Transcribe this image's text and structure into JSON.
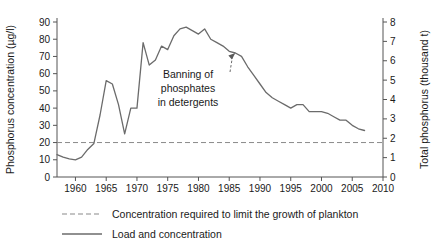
{
  "chart_data": {
    "type": "line",
    "title": "",
    "xlabel": "",
    "ylabel": "Phosphorus concentration (µg/l)",
    "y2label": "Total phosphorus (thousand t)",
    "xlim": [
      1957,
      2010
    ],
    "ylim": [
      0,
      90
    ],
    "y2lim": [
      0,
      8
    ],
    "grid": false,
    "legend_position": "bottom-left",
    "x_ticks": [
      1960,
      1965,
      1970,
      1975,
      1980,
      1985,
      1990,
      1995,
      2000,
      2005,
      2010
    ],
    "y_ticks": [
      0,
      10,
      20,
      30,
      40,
      50,
      60,
      70,
      80,
      90
    ],
    "y2_ticks": [
      0,
      1,
      2,
      3,
      4,
      5,
      6,
      7,
      8
    ],
    "series": [
      {
        "name": "Load and concentration",
        "style": "solid",
        "color": "#6b6b6b",
        "x": [
          1957,
          1958,
          1959,
          1960,
          1961,
          1962,
          1963,
          1964,
          1965,
          1966,
          1967,
          1968,
          1969,
          1970,
          1971,
          1972,
          1973,
          1974,
          1975,
          1976,
          1977,
          1978,
          1979,
          1980,
          1981,
          1982,
          1983,
          1984,
          1985,
          1986,
          1987,
          1988,
          1989,
          1990,
          1991,
          1992,
          1993,
          1994,
          1995,
          1996,
          1997,
          1998,
          1999,
          2000,
          2001,
          2002,
          2003,
          2004,
          2005,
          2006,
          2007
        ],
        "y": [
          13,
          11.5,
          10.5,
          10,
          11.5,
          16,
          19.5,
          36,
          56,
          54,
          42,
          25,
          40,
          40,
          78,
          65,
          68,
          76,
          74,
          82,
          86,
          87,
          85,
          83,
          86,
          80,
          78,
          76,
          73,
          72,
          70,
          64,
          59,
          54,
          49,
          46,
          44,
          42,
          40,
          42,
          42,
          38,
          38,
          38,
          37,
          35,
          33,
          33,
          30,
          28,
          27
        ]
      },
      {
        "name": "Concentration required to limit the growth of plankton",
        "style": "dashed",
        "color": "#8a8a8a",
        "constant_y": 20
      }
    ],
    "annotations": [
      {
        "text_lines": [
          "Banning of",
          "phosphates",
          "in detergents"
        ],
        "points_to_x": 1986,
        "points_to_y": 72
      }
    ]
  },
  "legend": {
    "items": [
      {
        "label": "Concentration required to limit the growth of plankton",
        "style": "dashed"
      },
      {
        "label": "Load and concentration",
        "style": "solid"
      }
    ]
  },
  "axes": {
    "left_title": "Phosphorus concentration (µg/l)",
    "right_title": "Total phosphorus (thousand t)"
  }
}
